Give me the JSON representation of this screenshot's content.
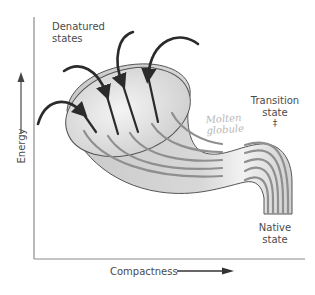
{
  "diagram": {
    "labels": {
      "denatured_line1": "Denatured",
      "denatured_line2": "states",
      "transition_line1": "Transition",
      "transition_line2": "state",
      "transition_symbol": "‡",
      "molten_line1": "Molten",
      "molten_line2": "globule",
      "native_line1": "Native",
      "native_line2": "state"
    },
    "axes": {
      "y_label": "Energy",
      "x_label": "Compactness"
    },
    "colors": {
      "funnel_fill": "#d6d6d6",
      "funnel_outline": "#555555",
      "path_lines": "#8f8f8f",
      "arrows": "#2b2b2b",
      "axis": "#8a8a8a",
      "text": "#4a4a4a",
      "molten_text": "#b8b8b8"
    }
  }
}
